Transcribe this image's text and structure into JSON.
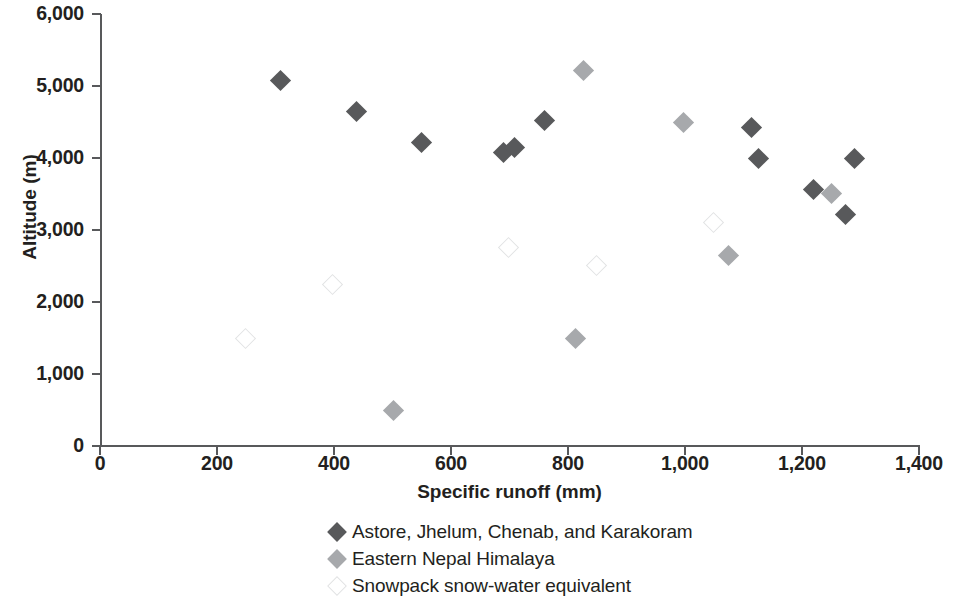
{
  "chart_data": {
    "type": "scatter",
    "title": "",
    "xlabel": "Specific runoff (mm)",
    "ylabel": "Altitude (m)",
    "xlim": [
      0,
      1400
    ],
    "ylim": [
      0,
      6000
    ],
    "xticks": [
      0,
      200,
      400,
      600,
      800,
      1000,
      1200,
      1400
    ],
    "xtick_labels": [
      "0",
      "200",
      "400",
      "600",
      "800",
      "1,000",
      "1,200",
      "1,400"
    ],
    "yticks": [
      0,
      1000,
      2000,
      3000,
      4000,
      5000,
      6000
    ],
    "ytick_labels": [
      "0",
      "1,000",
      "2,000",
      "3,000",
      "4,000",
      "5,000",
      "6,000"
    ],
    "grid": false,
    "legend_position": "bottom-center",
    "series": [
      {
        "name": "Astore, Jhelum, Chenab, and Karakoram",
        "color": "#58595b",
        "marker": "filled-diamond",
        "points": [
          {
            "x": 308,
            "y": 5070
          },
          {
            "x": 438,
            "y": 4640
          },
          {
            "x": 550,
            "y": 4210
          },
          {
            "x": 689,
            "y": 4070
          },
          {
            "x": 709,
            "y": 4140
          },
          {
            "x": 759,
            "y": 4520
          },
          {
            "x": 1114,
            "y": 4420
          },
          {
            "x": 1126,
            "y": 3990
          },
          {
            "x": 1220,
            "y": 3560
          },
          {
            "x": 1290,
            "y": 4000
          },
          {
            "x": 1275,
            "y": 3210
          }
        ]
      },
      {
        "name": "Eastern Nepal Himalaya",
        "color": "#a7a9ac",
        "marker": "filled-diamond",
        "points": [
          {
            "x": 998,
            "y": 4490
          },
          {
            "x": 827,
            "y": 5210
          },
          {
            "x": 812,
            "y": 1490
          },
          {
            "x": 501,
            "y": 500
          },
          {
            "x": 1074,
            "y": 2640
          },
          {
            "x": 1250,
            "y": 3510
          }
        ]
      },
      {
        "name": "Snowpack snow-water equivalent",
        "color": "#ffffff",
        "marker": "open-diamond",
        "points": [
          {
            "x": 249,
            "y": 1500
          },
          {
            "x": 397,
            "y": 2240
          },
          {
            "x": 699,
            "y": 2760
          },
          {
            "x": 849,
            "y": 2510
          },
          {
            "x": 1048,
            "y": 3110
          }
        ]
      }
    ]
  },
  "legend": {
    "items": [
      {
        "label": "Astore, Jhelum, Chenab, and Karakoram",
        "style": "dark"
      },
      {
        "label": "Eastern Nepal Himalaya",
        "style": "mid"
      },
      {
        "label": "Snowpack snow-water equivalent",
        "style": "open"
      }
    ]
  },
  "colors": {
    "dark_series": "#58595b",
    "mid_series": "#a7a9ac",
    "open_series": "#ffffff",
    "axis": "#58595b",
    "text": "#231f20"
  }
}
